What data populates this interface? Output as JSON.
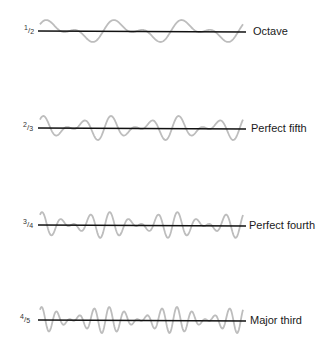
{
  "figure": {
    "rows": [
      {
        "ratio": {
          "num": "1",
          "den": "2"
        },
        "label": "Octave",
        "baseline_y": 31,
        "f1": 1,
        "f2": 2,
        "a1": 12,
        "a2": 9,
        "cycles_low": 3,
        "phase": 0.4
      },
      {
        "ratio": {
          "num": "2",
          "den": "3"
        },
        "label": "Perfect fifth",
        "baseline_y": 128,
        "f1": 2,
        "f2": 3,
        "a1": 11,
        "a2": 10,
        "cycles_low": 3,
        "phase": 0.3
      },
      {
        "ratio": {
          "num": "3",
          "den": "4"
        },
        "label": "Perfect fourth",
        "baseline_y": 225,
        "f1": 3,
        "f2": 4,
        "a1": 11,
        "a2": 11,
        "cycles_low": 3,
        "phase": 0.25
      },
      {
        "ratio": {
          "num": "4",
          "den": "5"
        },
        "label": "Major third",
        "baseline_y": 320,
        "f1": 4,
        "f2": 5,
        "a1": 11,
        "a2": 11,
        "cycles_low": 3,
        "phase": 0.2
      }
    ],
    "line_x_start": 38,
    "line_x_end": 246,
    "wave_x_start": 40,
    "wave_x_end": 243,
    "colors": {
      "wave": "#bdbdbd",
      "axis": "#111111",
      "text": "#1a1a1a"
    }
  }
}
